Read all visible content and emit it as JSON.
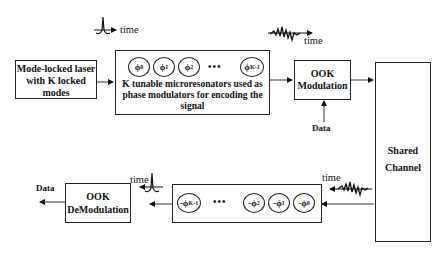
{
  "diagram": {
    "laser": {
      "label_lines": [
        "Mode-locked laser",
        "with K locked",
        "modes"
      ]
    },
    "encoder": {
      "rings": [
        {
          "symbol": "ϕ",
          "sub": "0"
        },
        {
          "symbol": "ϕ",
          "sub": "1"
        },
        {
          "symbol": "ϕ",
          "sub": "2"
        },
        {
          "symbol": "ϕ",
          "sub": "K-1"
        }
      ],
      "dots": "•••",
      "caption_lines": [
        "K tunable microresonators used as",
        "phase modulators for encoding the",
        "signal"
      ]
    },
    "ook_mod": {
      "label_lines": [
        "OOK",
        "Modulation"
      ]
    },
    "data_in": "Data",
    "channel": {
      "label_lines": [
        "Shared",
        "Channel"
      ]
    },
    "decoder": {
      "rings": [
        {
          "symbol": "-ϕ",
          "sub": "K-1"
        },
        {
          "symbol": "-ϕ",
          "sub": "2"
        },
        {
          "symbol": "-ϕ",
          "sub": "1"
        },
        {
          "symbol": "-ϕ",
          "sub": "0"
        }
      ],
      "dots": "•••"
    },
    "ook_demod": {
      "label_lines": [
        "OOK",
        "DeModulation"
      ]
    },
    "data_out": "Data",
    "time_labels": {
      "pulse_top": "time",
      "noise_top": "time",
      "noise_bottom": "time",
      "pulse_bottom": "time"
    }
  }
}
